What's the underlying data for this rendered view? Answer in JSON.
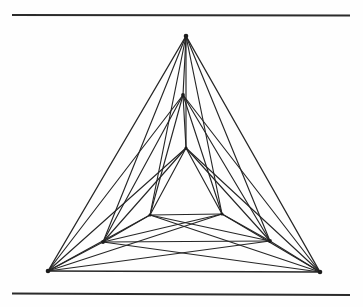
{
  "page": {
    "width": 363,
    "height": 307,
    "background_color": "#fefefe",
    "ink_color": "#262626"
  },
  "rules": {
    "stroke_color": "#2b2b2b",
    "items": [
      {
        "name": "top-rule",
        "x1": 12,
        "y1": 15,
        "x2": 350,
        "y2": 15.5
      },
      {
        "name": "bottom-rule",
        "x1": 12,
        "y1": 293.5,
        "x2": 350,
        "y2": 295
      }
    ]
  },
  "chart_data": {
    "type": "scatter",
    "title": "",
    "subtitle": "",
    "xlabel": "",
    "ylabel": "",
    "grid": false,
    "legend": null,
    "xlim": [
      0,
      363
    ],
    "ylim": [
      307,
      0
    ],
    "nodes": [
      {
        "id": "A1",
        "ring": "outer",
        "label": "outer-apex",
        "x": 186,
        "y": 36
      },
      {
        "id": "B1",
        "ring": "outer",
        "label": "outer-bottom-left",
        "x": 48,
        "y": 271
      },
      {
        "id": "C1",
        "ring": "outer",
        "label": "outer-bottom-right",
        "x": 320,
        "y": 272
      },
      {
        "id": "A2",
        "ring": "middle",
        "label": "middle-apex",
        "x": 183,
        "y": 95
      },
      {
        "id": "B2",
        "ring": "middle",
        "label": "middle-bottom-left",
        "x": 103,
        "y": 242
      },
      {
        "id": "C2",
        "ring": "middle",
        "label": "middle-bottom-right",
        "x": 270,
        "y": 241
      },
      {
        "id": "A3",
        "ring": "inner",
        "label": "inner-apex",
        "x": 186,
        "y": 148
      },
      {
        "id": "B3",
        "ring": "inner",
        "label": "inner-bottom-left",
        "x": 150,
        "y": 215
      },
      {
        "id": "C3",
        "ring": "inner",
        "label": "inner-bottom-right",
        "x": 222,
        "y": 214
      }
    ],
    "edges": [
      [
        "A1",
        "B1"
      ],
      [
        "A1",
        "C1"
      ],
      [
        "B1",
        "C1"
      ],
      [
        "A2",
        "B2"
      ],
      [
        "A2",
        "C2"
      ],
      [
        "B2",
        "C2"
      ],
      [
        "A3",
        "B3"
      ],
      [
        "A3",
        "C3"
      ],
      [
        "B3",
        "C3"
      ],
      [
        "A1",
        "A2"
      ],
      [
        "B1",
        "B2"
      ],
      [
        "C1",
        "C2"
      ],
      [
        "A2",
        "A3"
      ],
      [
        "B2",
        "B3"
      ],
      [
        "C2",
        "C3"
      ],
      [
        "A1",
        "B2"
      ],
      [
        "A1",
        "C2"
      ],
      [
        "B1",
        "A2"
      ],
      [
        "B1",
        "C2"
      ],
      [
        "C1",
        "A2"
      ],
      [
        "C1",
        "B2"
      ],
      [
        "A1",
        "B3"
      ],
      [
        "A1",
        "C3"
      ],
      [
        "B1",
        "A3"
      ],
      [
        "B1",
        "C3"
      ],
      [
        "C1",
        "A3"
      ],
      [
        "C1",
        "B3"
      ],
      [
        "A2",
        "B3"
      ],
      [
        "A2",
        "C3"
      ],
      [
        "B2",
        "A3"
      ],
      [
        "B2",
        "C3"
      ],
      [
        "C2",
        "A3"
      ],
      [
        "C2",
        "B3"
      ],
      [
        "A1",
        "A3"
      ],
      [
        "B1",
        "B3"
      ],
      [
        "C1",
        "C3"
      ]
    ],
    "counts": {
      "nodes": 9,
      "edges": 36,
      "triangles": 3
    }
  }
}
